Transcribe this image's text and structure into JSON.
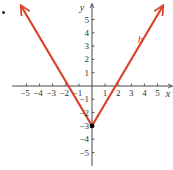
{
  "chart_data": {
    "type": "line",
    "title": "",
    "xlabel": "x",
    "ylabel": "y",
    "xlim": [
      -6,
      6
    ],
    "ylim": [
      -6,
      6
    ],
    "grid": false,
    "x_ticks": [
      -5,
      -4,
      -3,
      -2,
      -1,
      1,
      2,
      3,
      4,
      5
    ],
    "y_ticks": [
      -5,
      -4,
      -3,
      -2,
      -1,
      1,
      2,
      3,
      4,
      5
    ],
    "x_tick_labels": [
      "−5",
      "−4",
      "−3",
      "−2",
      "−1",
      "1",
      "2",
      "3",
      "4",
      "5"
    ],
    "y_tick_labels": [
      "−5",
      "−4",
      "−3",
      "−2",
      "−1",
      "1",
      "2",
      "3",
      "4",
      "5"
    ],
    "series": [
      {
        "name": "h",
        "color": "#d9452b",
        "x": [
          -5.4,
          0,
          5.4
        ],
        "y": [
          6.0,
          -3,
          6.0
        ],
        "arrows": "both-ends"
      }
    ],
    "points": [
      {
        "x": 0,
        "y": -3,
        "color": "#000000",
        "label": ""
      }
    ],
    "annotations": [
      {
        "text": "h",
        "x": 3.5,
        "y": 3.2,
        "color": "#d9452b",
        "style": "italic"
      }
    ]
  },
  "colors": {
    "axis": "#333333",
    "curve": "#d9452b",
    "point": "#000000"
  }
}
